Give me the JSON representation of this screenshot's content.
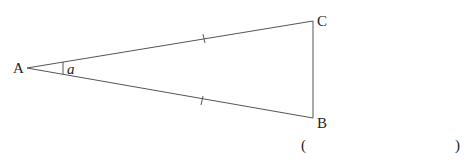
{
  "diagram": {
    "type": "isosceles-triangle",
    "vertices": {
      "A": {
        "label": "A",
        "x": 27,
        "y": 68
      },
      "C": {
        "label": "C",
        "x": 313,
        "y": 21
      },
      "B": {
        "label": "B",
        "x": 313,
        "y": 118
      }
    },
    "angle_label": "a",
    "equal_sides": [
      "AC",
      "AB"
    ],
    "line_color": "#555555"
  },
  "answer_blank": {
    "open": "(",
    "close": ")"
  }
}
